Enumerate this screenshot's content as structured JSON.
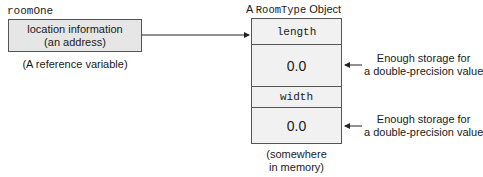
{
  "reference": {
    "variable_name": "roomOne",
    "box_line1": "location information",
    "box_line2": "(an address)",
    "caption": "(A reference variable)"
  },
  "object": {
    "title_prefix": "A",
    "title_type": "RoomType",
    "title_suffix": "Object",
    "fields": [
      {
        "name": "length",
        "value": "0.0",
        "note_line1": "Enough storage for",
        "note_line2": "a double-precision value"
      },
      {
        "name": "width",
        "value": "0.0",
        "note_line1": "Enough storage for",
        "note_line2": "a double-precision value"
      }
    ],
    "caption_line1": "(somewhere",
    "caption_line2": "in memory)"
  },
  "colors": {
    "box_fill": "#e6e6e6",
    "object_fill": "#f1f1f1",
    "line": "#555555"
  }
}
